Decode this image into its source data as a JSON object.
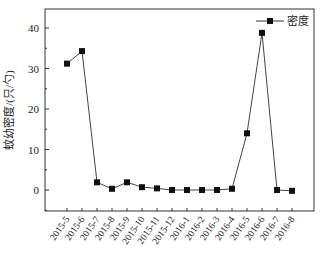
{
  "chart_data": {
    "type": "line",
    "title": "",
    "xlabel": "",
    "ylabel": "蚊幼密度/(只/勺)",
    "ylim": [
      -5,
      45
    ],
    "yticks": [
      0,
      10,
      20,
      30,
      40
    ],
    "categories": [
      "2015-5",
      "2015-6",
      "2015-7",
      "2015-8",
      "2015-9",
      "2015-10",
      "2015-11",
      "2015-12",
      "2016-1",
      "2016-2",
      "2016-3",
      "2016-4",
      "2016-5",
      "2016-6",
      "2016-7",
      "2016-8"
    ],
    "series": [
      {
        "name": "密度",
        "marker": "square",
        "values": [
          31.2,
          34.3,
          1.9,
          0.3,
          1.9,
          0.7,
          0.4,
          0.0,
          0.0,
          0.0,
          0.0,
          0.3,
          14.0,
          38.8,
          0.0,
          -0.2
        ]
      }
    ],
    "legend": {
      "position": "top-right",
      "entries": [
        "密度"
      ]
    },
    "grid": false
  }
}
